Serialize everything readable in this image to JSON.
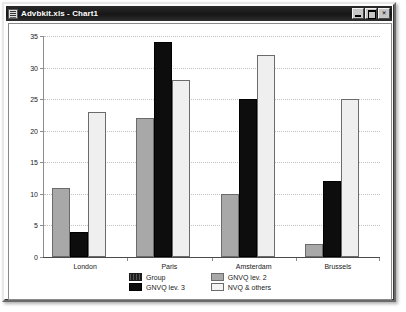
{
  "window": {
    "title": "Advbkit.xls - Chart1",
    "icon": "excel-document-icon",
    "buttons": {
      "minimize": "minimize-icon",
      "maximize": "maximize-icon",
      "close": "✕"
    }
  },
  "chart_data": {
    "type": "bar",
    "title": "",
    "subtitle": "",
    "xlabel": "",
    "ylabel": "",
    "ylim": [
      0,
      35
    ],
    "yticks": [
      0,
      5,
      10,
      15,
      20,
      25,
      30,
      35
    ],
    "grid": true,
    "legend_position": "bottom",
    "categories": [
      "London",
      "Paris",
      "Amsterdam",
      "Brussels"
    ],
    "series": [
      {
        "name": "Group",
        "color": "#3a3a3a",
        "values": [
          null,
          null,
          null,
          null
        ]
      },
      {
        "name": "GNVQ lev. 2",
        "color": "#a8a8a8",
        "values": [
          11,
          22,
          10,
          2
        ]
      },
      {
        "name": "GNVQ lev. 3",
        "color": "#0d0d0d",
        "values": [
          4,
          34,
          25,
          12
        ]
      },
      {
        "name": "NVQ & others",
        "color": "#efefef",
        "values": [
          23,
          28,
          32,
          25
        ]
      }
    ],
    "legend_entries": [
      {
        "label": "Group",
        "swatch": "s-group"
      },
      {
        "label": "GNVQ lev. 2",
        "swatch": "s-gnvq2"
      },
      {
        "label": "GNVQ lev. 3",
        "swatch": "s-gnvq3"
      },
      {
        "label": "NVQ & others",
        "swatch": "s-nvq"
      }
    ]
  }
}
